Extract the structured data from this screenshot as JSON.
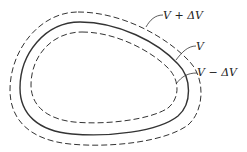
{
  "diagram": {
    "contours": [
      {
        "id": "outer",
        "label": "V + ΔV",
        "style": "dashed"
      },
      {
        "id": "middle",
        "label": "V",
        "style": "solid"
      },
      {
        "id": "inner",
        "label": "V − ΔV",
        "style": "dashed"
      }
    ]
  }
}
